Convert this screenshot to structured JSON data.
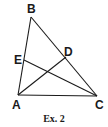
{
  "figure": {
    "caption": "Ex. 2",
    "points": {
      "A": {
        "label": "A",
        "x": 18,
        "y": 95
      },
      "B": {
        "label": "B",
        "x": 31,
        "y": 17
      },
      "C": {
        "label": "C",
        "x": 97,
        "y": 96
      },
      "D": {
        "label": "D",
        "x": 66,
        "y": 57
      },
      "E": {
        "label": "E",
        "x": 24,
        "y": 60
      }
    },
    "segments": [
      [
        "A",
        "B"
      ],
      [
        "B",
        "C"
      ],
      [
        "A",
        "C"
      ],
      [
        "A",
        "D"
      ],
      [
        "C",
        "E"
      ]
    ],
    "line_color": "#1a1a1a"
  }
}
